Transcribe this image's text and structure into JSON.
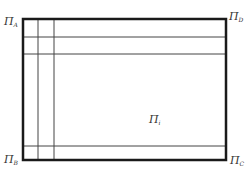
{
  "diagram": {
    "type": "rectangular-grid-region",
    "outer_rect": {
      "x": 23,
      "y": 19,
      "width": 203,
      "height": 141,
      "stroke": "#1a1a1a",
      "stroke_width": 2.5
    },
    "grid_lines": {
      "stroke": "#444444",
      "vertical_x": [
        38,
        54
      ],
      "horizontal_y": [
        37,
        54,
        146
      ]
    },
    "labels": {
      "top_left": {
        "symbol": "Π",
        "sub": "A"
      },
      "top_right": {
        "symbol": "Π",
        "sub": "D"
      },
      "bottom_left": {
        "symbol": "Π",
        "sub": "B"
      },
      "bottom_right": {
        "symbol": "Π",
        "sub": "C"
      },
      "interior": {
        "symbol": "Π",
        "sub": "i"
      }
    }
  }
}
